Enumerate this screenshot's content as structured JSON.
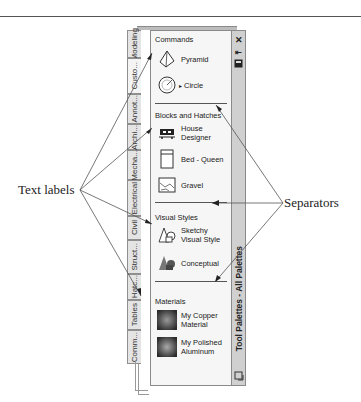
{
  "figure": {
    "annotations": {
      "left_label": "Text labels",
      "right_label": "Separators"
    }
  },
  "palette": {
    "title": "Tool Palettes - All Palettes",
    "titlebar_icons": [
      "close-icon",
      "auto-hide-icon",
      "properties-icon"
    ],
    "tabs": [
      {
        "label": "Modeling",
        "active": false
      },
      {
        "label": "Custo...",
        "active": true
      },
      {
        "label": "Annot...",
        "active": false
      },
      {
        "label": "Archi...",
        "active": false
      },
      {
        "label": "Mecha...",
        "active": false
      },
      {
        "label": "Electrical",
        "active": false
      },
      {
        "label": "Civil",
        "active": false
      },
      {
        "label": "Struct...",
        "active": false
      },
      {
        "label": "Hatc...",
        "active": false
      },
      {
        "label": "Tables",
        "active": false
      },
      {
        "label": "Comm...",
        "active": false
      }
    ],
    "sections": [
      {
        "header": "Commands",
        "tools": [
          {
            "label": "Pyramid",
            "icon": "pyramid-icon"
          },
          {
            "label": "Circle",
            "icon": "circle-icon",
            "flyout": "▸"
          }
        ]
      },
      {
        "header": "Blocks and Hatches",
        "tools": [
          {
            "label": "House Designer",
            "icon": "house-block-icon"
          },
          {
            "label": "Bed - Queen",
            "icon": "bed-block-icon"
          },
          {
            "label": "Gravel",
            "icon": "gravel-hatch-icon"
          }
        ]
      },
      {
        "header": "Visual Styles",
        "tools": [
          {
            "label": "Sketchy\nVisual Style",
            "label_line1": "Sketchy",
            "label_line2": "Visual Style",
            "icon": "sketchy-style-icon"
          },
          {
            "label": "Conceptual",
            "icon": "conceptual-style-icon"
          }
        ]
      },
      {
        "header": "Materials",
        "tools": [
          {
            "label_line1": "My Copper",
            "label_line2": "Material",
            "icon": "copper-material-icon"
          },
          {
            "label_line1": "My Polished",
            "label_line2": "Aluminum",
            "icon": "aluminum-material-icon"
          }
        ]
      }
    ]
  },
  "colors": {
    "panel_bg": "#f6f6f6",
    "titlebar_bg": "#d0d0d0",
    "tab_bg": "#e4e4e4",
    "border": "#8a8a8a",
    "line": "#555555"
  }
}
